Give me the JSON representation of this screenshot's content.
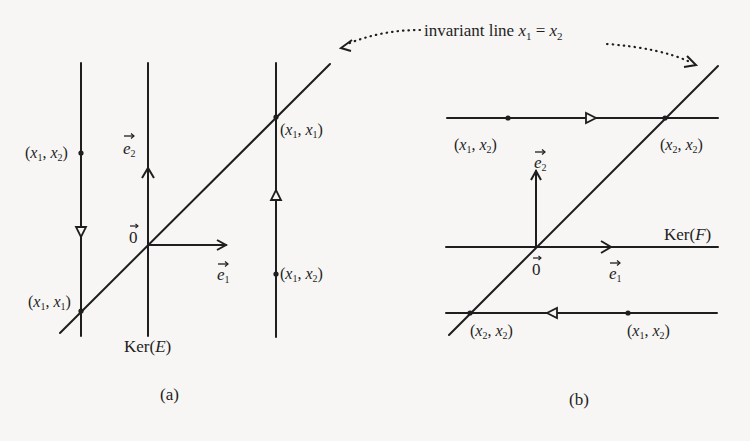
{
  "annotation": {
    "text": "invariant line ",
    "math_lhs": "x",
    "lhs_sub": "1",
    "eq": " = ",
    "math_rhs": "x",
    "rhs_sub": "2"
  },
  "panel_a": {
    "caption": "(a)",
    "kernel_label": "Ker(",
    "kernel_var": "E",
    "kernel_close": ")",
    "origin_label": "0",
    "e1_label": "e",
    "e1_sub": "1",
    "e2_label": "e",
    "e2_sub": "2",
    "points": [
      {
        "label_x": "x",
        "sub_a": "1",
        "label_y": "x",
        "sub_b": "2",
        "desc": "left line point"
      },
      {
        "label_x": "x",
        "sub_a": "1",
        "label_y": "x",
        "sub_b": "1",
        "desc": "left line fixed point"
      },
      {
        "label_x": "x",
        "sub_a": "1",
        "label_y": "x",
        "sub_b": "1",
        "desc": "right line fixed point"
      },
      {
        "label_x": "x",
        "sub_a": "1",
        "label_y": "x",
        "sub_b": "2",
        "desc": "right line point"
      }
    ]
  },
  "panel_b": {
    "caption": "(b)",
    "kernel_label": "Ker(",
    "kernel_var": "F",
    "kernel_close": ")",
    "origin_label": "0",
    "e1_label": "e",
    "e1_sub": "1",
    "e2_label": "e",
    "e2_sub": "2",
    "points": [
      {
        "label_x": "x",
        "sub_a": "1",
        "label_y": "x",
        "sub_b": "2",
        "desc": "top line point"
      },
      {
        "label_x": "x",
        "sub_a": "2",
        "label_y": "x",
        "sub_b": "2",
        "desc": "top line fixed point"
      },
      {
        "label_x": "x",
        "sub_a": "2",
        "label_y": "x",
        "sub_b": "2",
        "desc": "bottom line fixed point"
      },
      {
        "label_x": "x",
        "sub_a": "1",
        "label_y": "x",
        "sub_b": "2",
        "desc": "bottom line point"
      }
    ]
  },
  "colors": {
    "ink": "#1e1e1e",
    "paper": "#f7f6f4"
  }
}
